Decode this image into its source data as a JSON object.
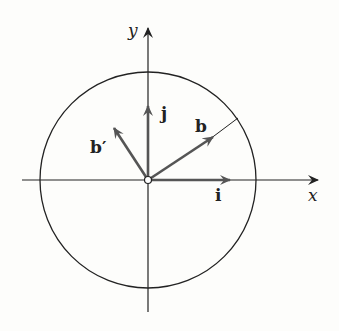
{
  "figure": {
    "axes": {
      "x_label": "x",
      "y_label": "y"
    },
    "vectors": [
      {
        "id": "i",
        "label": "i",
        "color": "#555555"
      },
      {
        "id": "j",
        "label": "j",
        "color": "#555555"
      },
      {
        "id": "b",
        "label": "b",
        "color": "#555555"
      },
      {
        "id": "b_prime",
        "label": "b′",
        "color": "#555555"
      }
    ],
    "circle": {
      "description": "circle centered at origin"
    },
    "origin_marker": "open circle"
  }
}
